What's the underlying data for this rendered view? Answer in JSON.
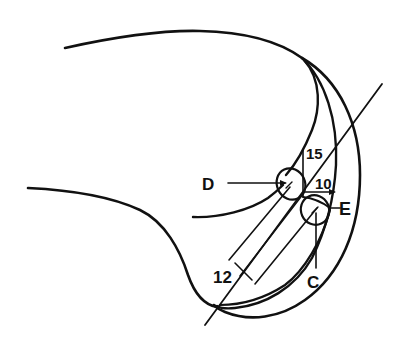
{
  "diagram": {
    "labels": {
      "D": "D",
      "E": "E",
      "C": "C",
      "dim_15": "15",
      "dim_10": "10",
      "dim_12": "12"
    },
    "colors": {
      "line": "#111111",
      "background": "#ffffff"
    }
  }
}
